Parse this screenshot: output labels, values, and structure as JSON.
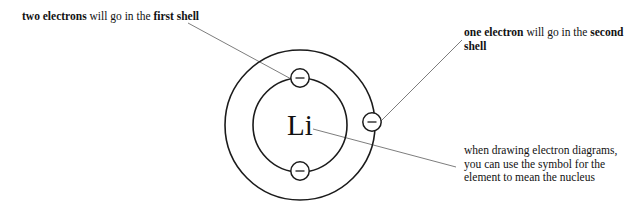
{
  "diagram": {
    "title_element_symbol": "Li",
    "element_symbol": "Li",
    "shells": [
      {
        "name": "first shell",
        "radius": 47,
        "electron_count": 2
      },
      {
        "name": "second shell",
        "radius": 75,
        "electron_count": 1
      }
    ],
    "electron_sign": "−",
    "colors": {
      "ring_stroke": "#1b1b1b",
      "leader_stroke": "#6e6e6e",
      "text": "#121212",
      "background": "#ffffff"
    }
  },
  "annotations": {
    "first_shell": {
      "bold_lead": "two electrons",
      "rest": " will go in the ",
      "bold_tail": "first shell",
      "full_text": "two electrons will go in the first shell"
    },
    "second_shell": {
      "bold_lead": "one electron",
      "rest": " will go in the ",
      "bold_tail": "second shell",
      "full_text": "one electron will go in the second shell"
    },
    "nucleus_note": {
      "full_text": "when drawing electron diagrams, you can use the symbol for the element to mean the nucleus"
    }
  }
}
